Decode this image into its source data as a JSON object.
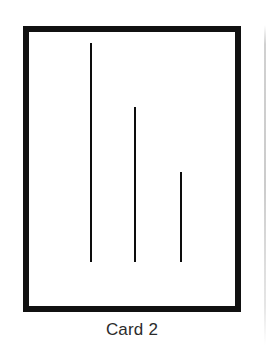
{
  "figure": {
    "caption": "Card 2",
    "card": {
      "border_color": "#111111",
      "fill_color": "#ffffff",
      "border_width_px": 6,
      "x": 23,
      "y": 26,
      "width": 218,
      "height": 286
    },
    "page_edge_rule": {
      "color": "#c8c8c8",
      "x": 264,
      "y": 25,
      "width": 2,
      "height": 320
    }
  },
  "chart_data": {
    "type": "bar",
    "title": "Card 2",
    "subtitle": "",
    "xlabel": "",
    "ylabel": "",
    "orientation": "vertical",
    "grid": false,
    "legend": null,
    "note": "Asch-style line judgement card: three vertical comparison lines of differing length sharing a common baseline.",
    "categories": [
      "Line A",
      "Line B",
      "Line C"
    ],
    "values": [
      219,
      155,
      90
    ],
    "units": "px",
    "baseline_y": 262,
    "ylim": [
      0,
      240
    ],
    "color": "#0d0d0d",
    "points": [
      {
        "label": "Line A",
        "x": 90,
        "top": 43,
        "bottom": 262,
        "length": 219,
        "thickness": 2
      },
      {
        "label": "Line B",
        "x": 134,
        "top": 107,
        "bottom": 262,
        "length": 155,
        "thickness": 2
      },
      {
        "label": "Line C",
        "x": 180,
        "top": 172,
        "bottom": 262,
        "length": 90,
        "thickness": 2
      }
    ]
  }
}
